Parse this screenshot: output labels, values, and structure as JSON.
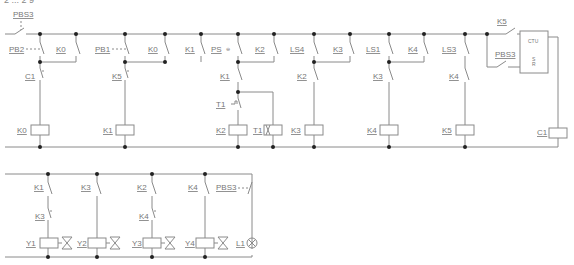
{
  "header_fragment": "2 ... 2 9",
  "ladder_main": {
    "rungs": [
      {
        "contacts": [
          "PBS3 (series, master)"
        ],
        "label": "PBS3"
      },
      {
        "contacts": [
          "PB2",
          "K0"
        ],
        "series": "C1",
        "coil": "K0"
      },
      {
        "contacts": [
          "PB1",
          "K0"
        ],
        "series": "K5",
        "coil": "K1"
      },
      {
        "contacts": [
          "K1"
        ],
        "coil": null
      },
      {
        "contacts": [
          "PS",
          "K2"
        ],
        "series": "K1",
        "timer_contact": "T1",
        "coils": [
          "K2",
          "T1"
        ]
      },
      {
        "contacts": [
          "LS4",
          "K3"
        ],
        "series": "K2",
        "coil": "K3"
      },
      {
        "contacts": [
          "LS1",
          "K4"
        ],
        "series": "K3",
        "coil": "K4"
      },
      {
        "contacts": [
          "LS3"
        ],
        "series": "K4",
        "coil": "K5"
      },
      {
        "contacts": [
          "K5",
          "PBS3"
        ],
        "block": "CTU",
        "coil": "C1"
      }
    ],
    "labels": {
      "pbs3_top": "PBS3",
      "pb2": "PB2",
      "k0_a": "K0",
      "c1_contact": "C1",
      "k0_coil": "K0",
      "pb1": "PB1",
      "k0_b": "K0",
      "k1_a": "K1",
      "k5_contact": "K5",
      "k1_coil": "K1",
      "ps": "PS",
      "k2_a": "K2",
      "k1_b": "K1",
      "t1_contact": "T1",
      "k2_coil": "K2",
      "t1_coil": "T1",
      "ls4": "LS4",
      "k3_a": "K3",
      "k2_b": "K2",
      "k3_coil": "K3",
      "ls1": "LS1",
      "k4_a": "K4",
      "k3_b": "K3",
      "k4_coil": "K4",
      "ls3": "LS3",
      "k4_b": "K4",
      "k5_coil": "K5",
      "k5_ctu": "K5",
      "pbs3_reset": "PBS3",
      "ctu": "CTU",
      "ctu_s": "S",
      "ctu_r": "R",
      "c1_coil": "C1"
    }
  },
  "ladder_output": {
    "labels": {
      "k1": "K1",
      "k3_series": "K3",
      "y1": "Y1",
      "k3": "K3",
      "y2": "Y2",
      "k2": "K2",
      "k4_series": "K4",
      "y3": "Y3",
      "k4": "K4",
      "y4": "Y4",
      "pbs3": "PBS3",
      "l1": "L1"
    }
  },
  "colors": {
    "wire": "#8a8a8a",
    "junction": "#222222",
    "text": "#777777"
  }
}
